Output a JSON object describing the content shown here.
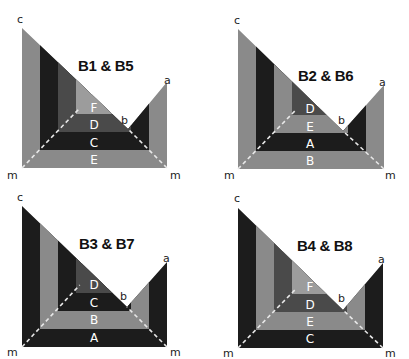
{
  "colors": {
    "light": "#8a8a8a",
    "mid": "#4a4a4a",
    "dark": "#1c1c1c",
    "lighter": "#9c9c9c",
    "dash": "#e8e8e8"
  },
  "points": {
    "c": "c",
    "a": "a",
    "b": "b",
    "m": "m"
  },
  "panels": [
    {
      "title": "B1 & B5",
      "bands": [
        {
          "label": "E",
          "shade": "light"
        },
        {
          "label": "C",
          "shade": "dark"
        },
        {
          "label": "D",
          "shade": "mid"
        },
        {
          "label": "F",
          "shade": "lighter"
        }
      ]
    },
    {
      "title": "B2 & B6",
      "bands": [
        {
          "label": "B",
          "shade": "light"
        },
        {
          "label": "A",
          "shade": "dark"
        },
        {
          "label": "E",
          "shade": "light"
        },
        {
          "label": "D",
          "shade": "mid"
        }
      ]
    },
    {
      "title": "B3 & B7",
      "bands": [
        {
          "label": "A",
          "shade": "dark"
        },
        {
          "label": "B",
          "shade": "light"
        },
        {
          "label": "C",
          "shade": "dark"
        },
        {
          "label": "D",
          "shade": "mid"
        }
      ]
    },
    {
      "title": "B4 & B8",
      "bands": [
        {
          "label": "C",
          "shade": "dark"
        },
        {
          "label": "E",
          "shade": "light"
        },
        {
          "label": "D",
          "shade": "mid"
        },
        {
          "label": "F",
          "shade": "lighter"
        }
      ]
    }
  ]
}
